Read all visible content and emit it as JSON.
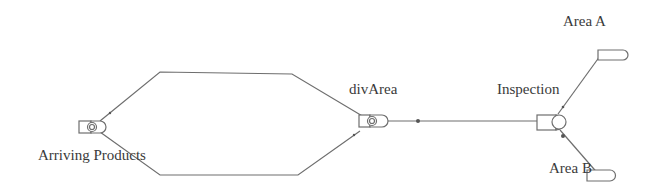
{
  "diagram": {
    "type": "process-flow",
    "colors": {
      "stroke": "#6e6e6e",
      "text": "#3a3a3a",
      "background": "#ffffff"
    },
    "nodes": [
      {
        "id": "arriving",
        "label": "Arriving Products",
        "kind": "source"
      },
      {
        "id": "divArea",
        "label": "divArea",
        "kind": "divider"
      },
      {
        "id": "inspection",
        "label": "Inspection",
        "kind": "server"
      },
      {
        "id": "areaA",
        "label": "Area A",
        "kind": "sink"
      },
      {
        "id": "areaB",
        "label": "Area B",
        "kind": "sink"
      }
    ],
    "edges": [
      {
        "from": "arriving",
        "to": "divArea",
        "route": "upper"
      },
      {
        "from": "arriving",
        "to": "divArea",
        "route": "lower"
      },
      {
        "from": "divArea",
        "to": "inspection"
      },
      {
        "from": "inspection",
        "to": "areaA"
      },
      {
        "from": "inspection",
        "to": "areaB"
      }
    ]
  }
}
